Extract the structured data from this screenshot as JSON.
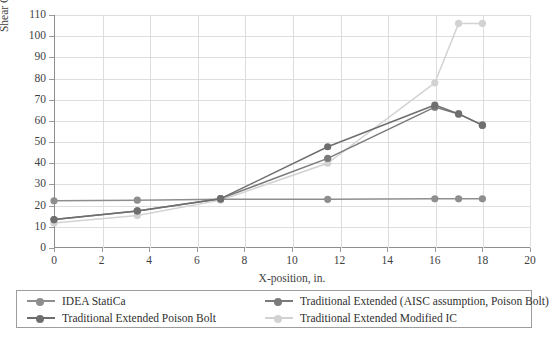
{
  "chart_data": {
    "type": "line",
    "title": "",
    "xlabel": "X-position, in.",
    "ylabel": "Shear Capacity, kips",
    "xlim": [
      0,
      20
    ],
    "ylim": [
      0,
      110
    ],
    "xticks": [
      0,
      2,
      4,
      6,
      8,
      10,
      12,
      14,
      16,
      18,
      20
    ],
    "yticks": [
      0,
      10,
      20,
      30,
      40,
      50,
      60,
      70,
      80,
      90,
      100,
      110
    ],
    "grid": true,
    "legend_position": "bottom",
    "series": [
      {
        "name": "IDEA StatiCa",
        "color": "#8e8e8e",
        "marker": "circle",
        "x": [
          0,
          3.5,
          7,
          11.5,
          16,
          17,
          18
        ],
        "y": [
          22.3,
          22.6,
          23.0,
          23.0,
          23.2,
          23.2,
          23.2
        ]
      },
      {
        "name": "Traditional Extended Poison Bolt",
        "color": "#6e6e6e",
        "marker": "circle",
        "x": [
          0,
          3.5,
          7,
          11.5,
          16,
          17,
          18
        ],
        "y": [
          13.4,
          17.5,
          23.3,
          47.8,
          67.5,
          63.3,
          58.0
        ]
      },
      {
        "name": "Traditional Extended (AISC assumption, Poison Bolt)",
        "color": "#7a7a7a",
        "marker": "circle",
        "x": [
          0,
          3.5,
          7,
          11.5,
          16,
          17,
          18
        ],
        "y": [
          13.4,
          17.5,
          23.3,
          42.3,
          66.5,
          63.3,
          58.0
        ]
      },
      {
        "name": "Traditional Extended Modified IC",
        "color": "#d2d2d2",
        "marker": "circle",
        "x": [
          0,
          3.5,
          7,
          11.5,
          16,
          17,
          18
        ],
        "y": [
          11.8,
          15.3,
          22.6,
          40.0,
          78.0,
          106.0,
          106.0
        ]
      }
    ]
  },
  "axes": {
    "y_title": "Shear Capacity, kips",
    "x_title": "X-position, in.",
    "y_tick_labels": [
      "110",
      "100",
      "90",
      "80",
      "70",
      "60",
      "50",
      "40",
      "30",
      "20",
      "10",
      "0"
    ],
    "x_tick_labels": [
      "0",
      "2",
      "4",
      "6",
      "8",
      "10",
      "12",
      "14",
      "16",
      "18",
      "20"
    ]
  },
  "legend": {
    "left_column": [
      {
        "label": "IDEA StatiCa",
        "color": "#8e8e8e"
      },
      {
        "label": "Traditional Extended Poison Bolt",
        "color": "#6e6e6e"
      }
    ],
    "right_column": [
      {
        "label": "Traditional Extended (AISC assumption, Poison Bolt)",
        "color": "#7a7a7a"
      },
      {
        "label": "Traditional Extended Modified IC",
        "color": "#d2d2d2"
      }
    ]
  }
}
